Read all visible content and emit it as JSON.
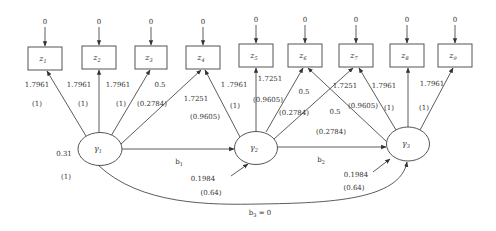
{
  "diagram": {
    "type": "structural equation model path diagram",
    "observed": [
      {
        "id": "z1",
        "name": "z",
        "sub": "1",
        "error": "0"
      },
      {
        "id": "z2",
        "name": "z",
        "sub": "2",
        "error": "0"
      },
      {
        "id": "z3",
        "name": "z",
        "sub": "3",
        "error": "0"
      },
      {
        "id": "z4",
        "name": "z",
        "sub": "4",
        "error": "0"
      },
      {
        "id": "z5",
        "name": "z",
        "sub": "5",
        "error": "0"
      },
      {
        "id": "z6",
        "name": "z",
        "sub": "6",
        "error": "0"
      },
      {
        "id": "z7",
        "name": "z",
        "sub": "7",
        "error": "0"
      },
      {
        "id": "z8",
        "name": "z",
        "sub": "8",
        "error": "0"
      },
      {
        "id": "z9",
        "name": "z",
        "sub": "9",
        "error": "0"
      }
    ],
    "latent": [
      {
        "id": "g1",
        "name": "γ",
        "sub": "1",
        "variance": "0.31",
        "variance_paren": "(1)"
      },
      {
        "id": "g2",
        "name": "γ",
        "sub": "2",
        "disturbance": "0.1984",
        "disturbance_paren": "(0.64)"
      },
      {
        "id": "g3",
        "name": "γ",
        "sub": "3",
        "disturbance": "0.1984",
        "disturbance_paren": "(0.64)"
      }
    ],
    "loadings": [
      {
        "from": "g1",
        "to": "z1",
        "value": "1.7961",
        "paren": "(1)"
      },
      {
        "from": "g1",
        "to": "z2",
        "value": "1.7961",
        "paren": "(1)"
      },
      {
        "from": "g1",
        "to": "z3",
        "value": "1.7961",
        "paren": "(1)"
      },
      {
        "from": "g1",
        "to": "z4",
        "value": "0.5",
        "paren": "(0.2784)"
      },
      {
        "from": "g2",
        "to": "z4",
        "value": "1.7251",
        "paren": "(0.9605)"
      },
      {
        "from": "g2",
        "to": "z4b",
        "value": "1 .7961",
        "paren": "(1)"
      },
      {
        "from": "g2",
        "to": "z5",
        "value": "1.7251",
        "paren": "(0.9605)"
      },
      {
        "from": "g2",
        "to": "z6",
        "value": "0.5",
        "paren": "(0.2784)"
      },
      {
        "from": "g2",
        "to": "z7",
        "value": "1.7251",
        "paren": ""
      },
      {
        "from": "g3",
        "to": "z6",
        "value": "0.5",
        "paren": "(0.2784)"
      },
      {
        "from": "g3",
        "to": "z7",
        "value": "1.7961",
        "paren": "(1)"
      },
      {
        "from": "g3",
        "to": "z7b",
        "value": "",
        "paren": "(0.9605)"
      },
      {
        "from": "g3",
        "to": "z8",
        "value": "1.7961",
        "paren": "(1)"
      },
      {
        "from": "g3",
        "to": "z9",
        "value": "",
        "paren": ""
      }
    ],
    "structural": [
      {
        "from": "g1",
        "to": "g2",
        "name": "b",
        "sub": "1"
      },
      {
        "from": "g2",
        "to": "g3",
        "name": "b",
        "sub": "2"
      },
      {
        "from": "g1",
        "to": "g3",
        "name": "b",
        "sub": "3",
        "suffix": " = 0"
      }
    ]
  }
}
